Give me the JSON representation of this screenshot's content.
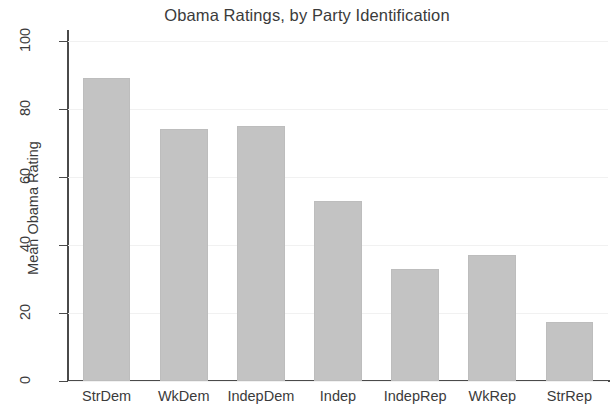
{
  "chart_data": {
    "type": "bar",
    "title": "Obama Ratings, by Party Identification",
    "xlabel": "",
    "ylabel": "Mean Obama Rating",
    "categories": [
      "StrDem",
      "WkDem",
      "IndepDem",
      "Indep",
      "IndepRep",
      "WkRep",
      "StrRep"
    ],
    "values": [
      89,
      74,
      75,
      53,
      33,
      37,
      17.5
    ],
    "ylim": [
      0,
      100
    ],
    "yticks": [
      0,
      20,
      40,
      60,
      80,
      100
    ],
    "ytick_labels": [
      "0",
      "20",
      "40",
      "60",
      "80",
      "100"
    ],
    "grid": true,
    "legend": null,
    "bar_color": "#c3c3c3",
    "axis_color": "#4a4a4a",
    "grid_color": "#f1f1f1",
    "text_color": "#3b3b3b"
  }
}
